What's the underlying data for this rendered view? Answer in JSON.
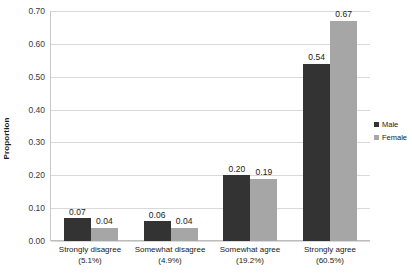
{
  "chart_data": {
    "type": "bar",
    "title": "",
    "xlabel": "",
    "ylabel": "Proportion",
    "ylim": [
      0.0,
      0.7
    ],
    "ytick_step": 0.1,
    "ytick_labels": [
      "0.70",
      "0.60",
      "0.50",
      "0.40",
      "0.30",
      "0.20",
      "0.10",
      "0.00"
    ],
    "ytick_values": [
      0.7,
      0.6,
      0.5,
      0.4,
      0.3,
      0.2,
      0.1,
      0.0
    ],
    "grid": true,
    "legend_position": "right",
    "categories": [
      "Strongly disagree",
      "Somewhat disagree",
      "Somewhat agree",
      "Strongly agree"
    ],
    "category_percents": [
      "(5.1%)",
      "(4.9%)",
      "(19.2%)",
      "(60.5%)"
    ],
    "series": [
      {
        "name": "Male",
        "color": "#333333",
        "values": [
          0.07,
          0.06,
          0.2,
          0.54
        ],
        "labels": [
          "0.07",
          "0.06",
          "0.20",
          "0.54"
        ]
      },
      {
        "name": "Female",
        "color": "#a6a6a6",
        "values": [
          0.04,
          0.04,
          0.19,
          0.67
        ],
        "labels": [
          "0.04",
          "0.04",
          "0.19",
          "0.67"
        ]
      }
    ]
  },
  "legend": {
    "items": [
      {
        "label": "Male",
        "swatch": "male"
      },
      {
        "label": "Female",
        "swatch": "female"
      }
    ]
  }
}
